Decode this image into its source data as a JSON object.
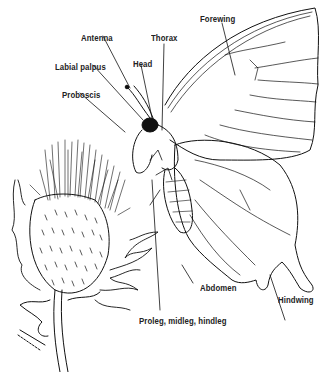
{
  "diagram": {
    "labels": {
      "antenna": "Antenna",
      "labial_palpus": "Labial palpus",
      "proboscis": "Proboscis",
      "head": "Head",
      "thorax": "Thorax",
      "forewing": "Forewing",
      "abdomen": "Abdomen",
      "hindwing": "Hindwing",
      "legs": "Proleg, midleg, hindleg"
    },
    "colors": {
      "ink": "#111111",
      "background": "#ffffff"
    }
  }
}
